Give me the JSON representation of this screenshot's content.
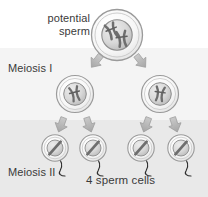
{
  "diagram": {
    "labels": {
      "potential_sperm": "potential\nsperm",
      "meiosis_one": "Meiosis I",
      "meiosis_two": "Meiosis II",
      "four_sperm_cells": "4 sperm cells"
    },
    "colors": {
      "band_top": "#ffffff",
      "band_middle": "#f4f4f4",
      "band_bottom": "#e9e9e9",
      "cell_membrane": "#9a9a9a",
      "cell_fill": "#f7f7f7",
      "nucleus_fill": "#d8d8d8",
      "nucleus_stroke": "#8d8d8d",
      "chromosome": "#6e6e6e",
      "arrow": "#b4b4b4",
      "arrow_stroke": "#9c9c9c",
      "tail": "#2e2e2e",
      "text": "#3a3a3a"
    },
    "stages": [
      {
        "name": "potential-sperm",
        "cell_count": 1,
        "chromosomes_per_cell": 2,
        "chromosome_shape": "X",
        "has_tail": false
      },
      {
        "name": "meiosis-i",
        "cell_count": 2,
        "chromosomes_per_cell": 1,
        "chromosome_shape": "X",
        "has_tail": false
      },
      {
        "name": "meiosis-ii",
        "cell_count": 4,
        "chromosomes_per_cell": 1,
        "chromosome_shape": "rod",
        "has_tail": true
      }
    ],
    "arrows": {
      "meiosis_one_count": 2,
      "meiosis_two_count": 4,
      "style": "block-arrow-down"
    }
  }
}
